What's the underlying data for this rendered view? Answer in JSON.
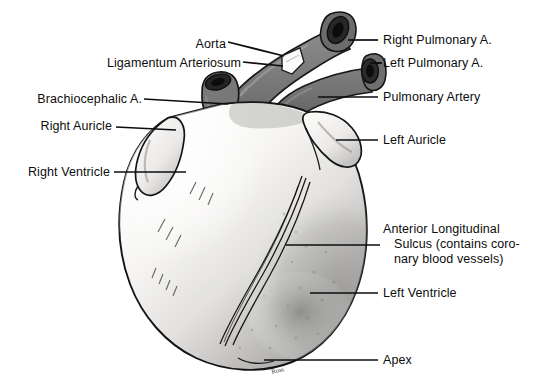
{
  "figure": {
    "background_color": "#ffffff",
    "ink_color": "#0d0d0d",
    "vessel_color": "#787878",
    "vessel_dark_color": "#4a4a4a",
    "lumen_color": "#1c1c1c",
    "myocardium_light_color": "#f4f3f1",
    "myocardium_shadow_color": "#a8a8a8",
    "artist_signature": "Ross"
  },
  "labels": {
    "aorta": "Aorta",
    "ligamentum_arteriosum": "Ligamentum Arteriosum",
    "brachiocephalic_artery": "Brachiocephalic A.",
    "right_auricle": "Right Auricle",
    "right_ventricle": "Right Ventricle",
    "right_pulmonary_artery": "Right Pulmonary A.",
    "left_pulmonary_artery": "Left Pulmonary A.",
    "pulmonary_artery": "Pulmonary Artery",
    "left_auricle": "Left Auricle",
    "anterior_longitudinal_sulcus_line1": "Anterior Longitudinal",
    "anterior_longitudinal_sulcus_line2": "Sulcus (contains coro-",
    "anterior_longitudinal_sulcus_line3": "nary blood vessels)",
    "left_ventricle": "Left Ventricle",
    "apex": "Apex"
  },
  "structures": [
    {
      "name": "aorta",
      "side": "left",
      "kind": "great-vessel"
    },
    {
      "name": "ligamentum-arteriosum",
      "side": "left",
      "kind": "ligament"
    },
    {
      "name": "brachiocephalic-artery",
      "side": "left",
      "kind": "great-vessel"
    },
    {
      "name": "right-auricle",
      "side": "left",
      "kind": "chamber-appendage"
    },
    {
      "name": "right-ventricle",
      "side": "left",
      "kind": "chamber"
    },
    {
      "name": "right-pulmonary-artery",
      "side": "right",
      "kind": "great-vessel"
    },
    {
      "name": "left-pulmonary-artery",
      "side": "right",
      "kind": "great-vessel"
    },
    {
      "name": "pulmonary-artery",
      "side": "right",
      "kind": "great-vessel"
    },
    {
      "name": "left-auricle",
      "side": "right",
      "kind": "chamber-appendage"
    },
    {
      "name": "anterior-longitudinal-sulcus",
      "side": "right",
      "kind": "sulcus"
    },
    {
      "name": "left-ventricle",
      "side": "right",
      "kind": "chamber"
    },
    {
      "name": "apex",
      "side": "right",
      "kind": "landmark"
    }
  ]
}
